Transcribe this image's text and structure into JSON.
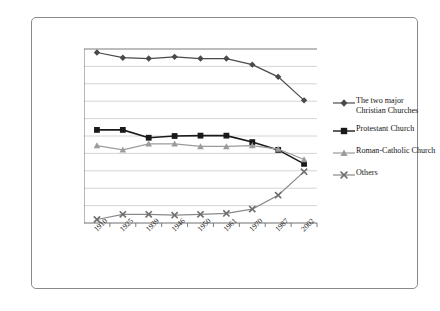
{
  "chart_data": {
    "type": "line",
    "title": "",
    "xlabel": "",
    "ylabel": "",
    "categories": [
      "1910",
      "1925",
      "1939",
      "1946",
      "1950",
      "1961",
      "1970",
      "1987",
      "2002"
    ],
    "ylim": [
      0,
      100
    ],
    "ytick_labels": [
      "0%",
      "10%",
      "20%",
      "30%",
      "40%",
      "50%",
      "60%",
      "70%",
      "80%",
      "90%",
      "100%"
    ],
    "ytick_values": [
      0,
      10,
      20,
      30,
      40,
      50,
      60,
      70,
      80,
      90,
      100
    ],
    "grid": true,
    "legend_position": "right",
    "series": [
      {
        "name": "The two major\nChristian Churches",
        "marker": "diamond",
        "color": "#4a4a4a",
        "values": [
          98,
          95,
          94.5,
          95.5,
          94.5,
          94.5,
          91,
          84,
          70.5
        ]
      },
      {
        "name": "Protestant Church",
        "marker": "square",
        "color": "#1a1a1a",
        "values": [
          53.5,
          53.5,
          49,
          50,
          50.2,
          50.2,
          46.5,
          42,
          34
        ]
      },
      {
        "name": "Roman-Catholic Church",
        "marker": "triangle",
        "color": "#9b9b9b",
        "values": [
          44.5,
          42,
          45.5,
          45.5,
          44,
          44,
          44.5,
          42.5,
          36.5
        ]
      },
      {
        "name": "Others",
        "marker": "x",
        "color": "#8a8a8a",
        "values": [
          2,
          5,
          5,
          4.5,
          5,
          5.5,
          8,
          16,
          29.5
        ]
      }
    ]
  },
  "legend": {
    "items": [
      {
        "label": "The two major\nChristian Churches",
        "marker": "diamond",
        "color": "#4a4a4a"
      },
      {
        "label": "Protestant Church",
        "marker": "square",
        "color": "#1a1a1a"
      },
      {
        "label": "Roman-Catholic Church",
        "marker": "triangle",
        "color": "#9b9b9b"
      },
      {
        "label": "Others",
        "marker": "x",
        "color": "#8a8a8a"
      }
    ]
  },
  "colors": {
    "frame_border": "#8a8a8a",
    "axis": "#6e6e6e",
    "grid": "#c9c9c9",
    "background": "#ffffff",
    "text": "#1a1a1a"
  }
}
